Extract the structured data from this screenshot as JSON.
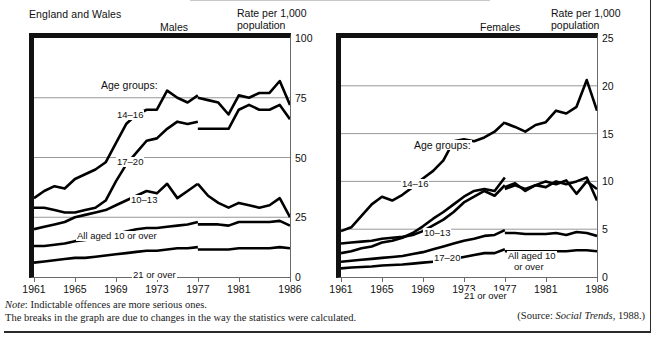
{
  "header": {
    "region": "England and Wales"
  },
  "note": {
    "line1_lead": "Note",
    "line1": ": Indictable offences are more serious ones.",
    "line2": "The breaks in the graph are due to changes in the way the statistics were calculated."
  },
  "source": {
    "prefix": "(Source: ",
    "title": "Social Trends",
    "suffix": ", 1988.)"
  },
  "chart_data": [
    {
      "type": "line",
      "title": "Males",
      "xlabel": "",
      "ylabel": "Rate per 1,000 population",
      "ylabel_line1": "Rate per 1,000",
      "ylabel_line2": "population",
      "grid": true,
      "legend": "inline-labels",
      "xlim": [
        1961,
        1986
      ],
      "ylim": [
        0,
        100
      ],
      "yticks": [
        0,
        25,
        50,
        75,
        100
      ],
      "xticks": [
        1961,
        1965,
        1969,
        1973,
        1977,
        1981,
        1986
      ],
      "annotations": [
        "Age groups:"
      ],
      "break_year": 1977,
      "series": [
        {
          "name": "14-16",
          "label": "14–16",
          "x": [
            1961,
            1962,
            1963,
            1964,
            1965,
            1966,
            1967,
            1968,
            1969,
            1970,
            1971,
            1972,
            1973,
            1974,
            1975,
            1976,
            1977
          ],
          "values": [
            33,
            36,
            38,
            37,
            41,
            43,
            45,
            48,
            56,
            64,
            68,
            70,
            70,
            78,
            75,
            73,
            76
          ],
          "x2": [
            1977,
            1978,
            1979,
            1980,
            1981,
            1982,
            1983,
            1984,
            1985,
            1986
          ],
          "values2": [
            75,
            74,
            73,
            68,
            76,
            75,
            77,
            77,
            82,
            72
          ]
        },
        {
          "name": "17-20",
          "label": "17–20",
          "x": [
            1961,
            1962,
            1963,
            1964,
            1965,
            1966,
            1967,
            1968,
            1969,
            1970,
            1971,
            1972,
            1973,
            1974,
            1975,
            1976,
            1977
          ],
          "values": [
            29,
            29,
            28,
            27,
            27,
            28,
            29,
            32,
            40,
            47,
            52,
            57,
            58,
            62,
            65,
            64,
            65
          ],
          "x2": [
            1977,
            1978,
            1979,
            1980,
            1981,
            1982,
            1983,
            1984,
            1985,
            1986
          ],
          "values2": [
            62,
            62,
            62,
            62,
            70,
            72,
            70,
            70,
            72,
            66
          ]
        },
        {
          "name": "10-13",
          "label": "10–13",
          "x": [
            1961,
            1962,
            1963,
            1964,
            1965,
            1966,
            1967,
            1968,
            1969,
            1970,
            1971,
            1972,
            1973,
            1974,
            1975,
            1976,
            1977
          ],
          "values": [
            20,
            21,
            22,
            23,
            25,
            26,
            27,
            28,
            30,
            32,
            34,
            36,
            35,
            39,
            33,
            36,
            39
          ],
          "x2": [
            1977,
            1978,
            1979,
            1980,
            1981,
            1982,
            1983,
            1984,
            1985,
            1986
          ],
          "values2": [
            39,
            34,
            31,
            29,
            31,
            30,
            29,
            30,
            33,
            25
          ]
        },
        {
          "name": "All aged 10 or over",
          "label": "All aged 10 or over",
          "x": [
            1961,
            1962,
            1963,
            1964,
            1965,
            1966,
            1967,
            1968,
            1969,
            1970,
            1971,
            1972,
            1973,
            1974,
            1975,
            1976,
            1977
          ],
          "values": [
            13,
            13,
            13.5,
            14,
            15,
            15.5,
            16,
            16.5,
            18,
            19,
            20,
            20.5,
            20.5,
            21,
            21.5,
            22,
            23
          ],
          "x2": [
            1977,
            1978,
            1979,
            1980,
            1981,
            1982,
            1983,
            1984,
            1985,
            1986
          ],
          "values2": [
            22,
            22,
            22,
            21.5,
            23,
            23,
            23,
            23,
            23.5,
            21.5
          ]
        },
        {
          "name": "21 or over",
          "label": "21 or over",
          "x": [
            1961,
            1962,
            1963,
            1964,
            1965,
            1966,
            1967,
            1968,
            1969,
            1970,
            1971,
            1972,
            1973,
            1974,
            1975,
            1976,
            1977
          ],
          "values": [
            6,
            6.5,
            7,
            7.5,
            8,
            8,
            8.5,
            9,
            9.5,
            10,
            10.5,
            11,
            11,
            11.5,
            12,
            12,
            12.5
          ],
          "x2": [
            1977,
            1978,
            1979,
            1980,
            1981,
            1982,
            1983,
            1984,
            1985,
            1986
          ],
          "values2": [
            11.5,
            11.5,
            11.5,
            11.5,
            12,
            12,
            12,
            12,
            12.5,
            12
          ]
        }
      ]
    },
    {
      "type": "line",
      "title": "Females",
      "xlabel": "",
      "ylabel": "Rate per 1,000 population",
      "ylabel_line1": "Rate per 1,000",
      "ylabel_line2": "population",
      "grid": true,
      "legend": "inline-labels",
      "xlim": [
        1961,
        1986
      ],
      "ylim": [
        0,
        25
      ],
      "yticks": [
        0,
        5,
        10,
        15,
        20,
        25
      ],
      "xticks": [
        1961,
        1965,
        1969,
        1973,
        1977,
        1981,
        1986
      ],
      "annotations": [
        "Age groups:"
      ],
      "break_year": 1977,
      "series": [
        {
          "name": "14-16",
          "label": "14–16",
          "x": [
            1961,
            1962,
            1963,
            1964,
            1965,
            1966,
            1967,
            1968,
            1969,
            1970,
            1971,
            1972,
            1973,
            1974,
            1975,
            1976,
            1977
          ],
          "values": [
            4.8,
            5.2,
            6.4,
            7.6,
            8.4,
            8.0,
            8.6,
            9.4,
            10.3,
            11.1,
            12.2,
            14.2,
            14.4,
            14.2,
            14.6,
            15.2,
            16.2
          ],
          "x2": [
            1977,
            1978,
            1979,
            1980,
            1981,
            1982,
            1983,
            1984,
            1985,
            1986
          ],
          "values2": [
            16.1,
            15.7,
            15.2,
            15.9,
            16.2,
            17.4,
            17.1,
            17.8,
            20.6,
            17.4
          ]
        },
        {
          "name": "10-13",
          "label": "10–13",
          "x": [
            1961,
            1962,
            1963,
            1964,
            1965,
            1966,
            1967,
            1968,
            1969,
            1970,
            1971,
            1972,
            1973,
            1974,
            1975,
            1976,
            1977
          ],
          "values": [
            2.5,
            2.7,
            3.0,
            3.2,
            3.6,
            3.8,
            4.1,
            4.6,
            5.3,
            6.1,
            6.8,
            7.6,
            8.4,
            9.0,
            9.2,
            9.0,
            10.4
          ],
          "x2": [
            1977,
            1978,
            1979,
            1980,
            1981,
            1982,
            1983,
            1984,
            1985,
            1986
          ],
          "values2": [
            9.4,
            9.8,
            9.0,
            9.6,
            10.0,
            9.7,
            10.1,
            8.7,
            10.0,
            9.2
          ]
        },
        {
          "name": "17-20",
          "label": "17–20",
          "x": [
            1961,
            1962,
            1963,
            1964,
            1965,
            1966,
            1967,
            1968,
            1969,
            1970,
            1971,
            1972,
            1973,
            1974,
            1975,
            1976,
            1977
          ],
          "values": [
            3.5,
            3.6,
            3.7,
            3.8,
            4.0,
            4.1,
            4.2,
            4.4,
            4.8,
            5.4,
            6.0,
            6.8,
            7.8,
            8.4,
            9.0,
            8.5,
            9.6
          ],
          "x2": [
            1977,
            1978,
            1979,
            1980,
            1981,
            1982,
            1983,
            1984,
            1985,
            1986
          ],
          "values2": [
            9.2,
            9.6,
            9.2,
            9.6,
            9.4,
            10.0,
            9.7,
            10.0,
            10.4,
            8.0
          ]
        },
        {
          "name": "All aged 10 or over",
          "label_line1": "All aged 10",
          "label_line2": "or over",
          "x": [
            1961,
            1962,
            1963,
            1964,
            1965,
            1966,
            1967,
            1968,
            1969,
            1970,
            1971,
            1972,
            1973,
            1974,
            1975,
            1976,
            1977
          ],
          "values": [
            1.6,
            1.7,
            1.8,
            1.9,
            2.0,
            2.1,
            2.2,
            2.4,
            2.6,
            2.9,
            3.2,
            3.5,
            3.8,
            4.0,
            4.3,
            4.4,
            4.9
          ],
          "x2": [
            1977,
            1978,
            1979,
            1980,
            1981,
            1982,
            1983,
            1984,
            1985,
            1986
          ],
          "values2": [
            4.6,
            4.6,
            4.5,
            4.5,
            4.5,
            4.6,
            4.4,
            4.7,
            4.6,
            4.3
          ]
        },
        {
          "name": "21 or over",
          "label": "21 or over",
          "x": [
            1961,
            1962,
            1963,
            1964,
            1965,
            1966,
            1967,
            1968,
            1969,
            1970,
            1971,
            1972,
            1973,
            1974,
            1975,
            1976,
            1977
          ],
          "values": [
            0.9,
            1.0,
            1.05,
            1.1,
            1.2,
            1.25,
            1.3,
            1.4,
            1.5,
            1.6,
            1.7,
            1.9,
            2.1,
            2.3,
            2.5,
            2.5,
            2.9
          ],
          "x2": [
            1977,
            1978,
            1979,
            1980,
            1981,
            1982,
            1983,
            1984,
            1985,
            1986
          ],
          "values2": [
            2.7,
            2.7,
            2.7,
            2.7,
            2.7,
            2.7,
            2.7,
            2.8,
            2.8,
            2.7
          ]
        }
      ]
    }
  ]
}
